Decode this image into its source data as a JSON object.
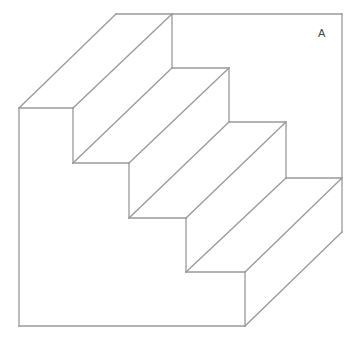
{
  "figure": {
    "label": "A",
    "stroke_color": "#9a9a9a",
    "background": "#ffffff",
    "steps": 4
  },
  "geometry": {
    "outer_left_x": 19,
    "outer_top_y": 108,
    "bottom_y": 326,
    "back_right_x": 342,
    "back_top_y": 14,
    "depth_offset": [
      97,
      -94
    ],
    "riser_x": [
      73,
      129,
      186,
      245
    ],
    "tread_y": [
      108,
      163,
      218,
      272,
      326
    ]
  }
}
